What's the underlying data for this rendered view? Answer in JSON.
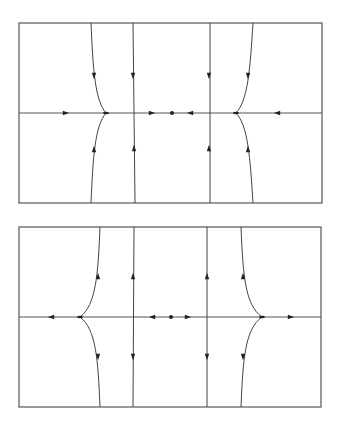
{
  "colors": {
    "background": "#ffffff",
    "frame": "#555555",
    "trajectory": "#444444",
    "arrow": "#222222"
  },
  "panels": [
    {
      "id": "top-phase-portrait",
      "description": "stable flow: trajectories converge onto horizontal axis and toward central fixed point",
      "frame": {
        "x": 19,
        "y": 23,
        "w": 303,
        "h": 180
      },
      "axis_y": 113,
      "trajectories": [
        {
          "name": "left-curve-upper",
          "d": "M 91 23 C 93 70, 95 100, 106 113"
        },
        {
          "name": "left-curve-lower",
          "d": "M 91 203 C 93 156, 95 126, 106 113"
        },
        {
          "name": "left-vertical",
          "d": "M 133 23 L 135 203"
        },
        {
          "name": "right-vertical",
          "d": "M 210 23 L 210 203"
        },
        {
          "name": "right-curve-upper",
          "d": "M 253 23 C 250 70, 248 100, 236 113"
        },
        {
          "name": "right-curve-lower",
          "d": "M 253 203 C 250 156, 248 126, 236 113"
        }
      ],
      "arrows": [
        {
          "x": 66,
          "y": 113,
          "dir": "right"
        },
        {
          "x": 152,
          "y": 113,
          "dir": "right"
        },
        {
          "x": 190,
          "y": 113,
          "dir": "left"
        },
        {
          "x": 277,
          "y": 113,
          "dir": "left"
        },
        {
          "x": 94,
          "y": 76,
          "dir": "down"
        },
        {
          "x": 133,
          "y": 76,
          "dir": "down"
        },
        {
          "x": 209,
          "y": 76,
          "dir": "down"
        },
        {
          "x": 248,
          "y": 76,
          "dir": "down"
        },
        {
          "x": 94,
          "y": 149,
          "dir": "up"
        },
        {
          "x": 134,
          "y": 148,
          "dir": "up"
        },
        {
          "x": 209,
          "y": 148,
          "dir": "up"
        },
        {
          "x": 248,
          "y": 149,
          "dir": "up"
        }
      ],
      "fixed_points": [
        {
          "x": 172,
          "y": 113
        }
      ],
      "junctions": [
        {
          "x": 106,
          "y": 113
        },
        {
          "x": 236,
          "y": 113
        }
      ]
    },
    {
      "id": "bottom-phase-portrait",
      "description": "unstable flow: trajectories diverge away from horizontal axis and central fixed point",
      "frame": {
        "x": 19,
        "y": 227,
        "w": 302,
        "h": 180
      },
      "axis_y": 317,
      "trajectories": [
        {
          "name": "left-curve-upper",
          "d": "M 100 227 C 98 275, 96 305, 80 317"
        },
        {
          "name": "left-curve-lower",
          "d": "M 100 407 C 98 359, 96 329, 80 317"
        },
        {
          "name": "left-vertical",
          "d": "M 134 227 L 133 407"
        },
        {
          "name": "right-vertical",
          "d": "M 207 227 L 207 407"
        },
        {
          "name": "right-curve-upper",
          "d": "M 241 227 C 243 275, 245 305, 262 317"
        },
        {
          "name": "right-curve-lower",
          "d": "M 241 407 C 243 359, 245 329, 262 317"
        }
      ],
      "arrows": [
        {
          "x": 51,
          "y": 317,
          "dir": "left"
        },
        {
          "x": 152,
          "y": 317,
          "dir": "left"
        },
        {
          "x": 188,
          "y": 317,
          "dir": "right"
        },
        {
          "x": 291,
          "y": 317,
          "dir": "right"
        },
        {
          "x": 98,
          "y": 276,
          "dir": "up"
        },
        {
          "x": 133,
          "y": 276,
          "dir": "up"
        },
        {
          "x": 207,
          "y": 276,
          "dir": "up"
        },
        {
          "x": 243,
          "y": 276,
          "dir": "up"
        },
        {
          "x": 98,
          "y": 357,
          "dir": "down"
        },
        {
          "x": 133,
          "y": 357,
          "dir": "down"
        },
        {
          "x": 207,
          "y": 357,
          "dir": "down"
        },
        {
          "x": 243,
          "y": 357,
          "dir": "down"
        }
      ],
      "fixed_points": [
        {
          "x": 171,
          "y": 317
        }
      ],
      "junctions": [
        {
          "x": 80,
          "y": 317
        },
        {
          "x": 262,
          "y": 317
        }
      ]
    }
  ]
}
